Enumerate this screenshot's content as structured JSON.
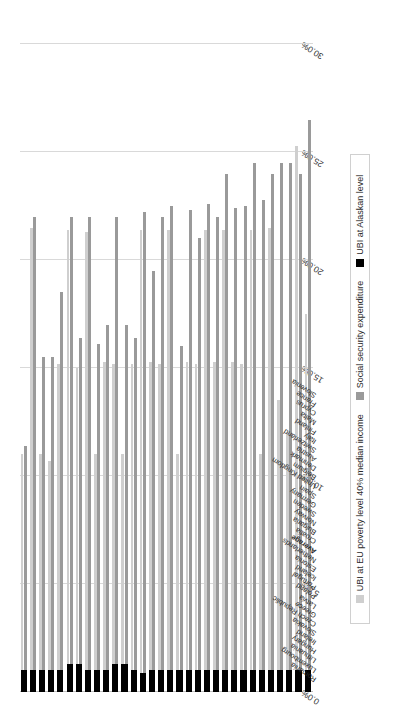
{
  "chart_data": {
    "type": "bar",
    "orientation": "horizontal",
    "title": "",
    "xlabel": "",
    "ylabel": "",
    "xlim": [
      0,
      30
    ],
    "xticks": [
      "0.0%",
      "5.0%",
      "10.0%",
      "15.0%",
      "20.0%",
      "25.0%",
      "30.0%"
    ],
    "grid": true,
    "legend_position": "bottom",
    "categories": [
      "Romania",
      "Luxembourg",
      "Lithuania",
      "Hungary",
      "Ireland",
      "Slovakia",
      "Czech Republic",
      "Greece",
      "Latvia",
      "Poland",
      "Portugal",
      "Iceland",
      "Estonia",
      "Netherlands",
      "Average",
      "Croatia",
      "Bulgaria",
      "Norway",
      "Sweden",
      "Germany",
      "Spain",
      "United Kingdom",
      "Belgium",
      "Denmark",
      "Austria",
      "Switzerland",
      "Italy",
      "Finland",
      "Malta",
      "Cyprus",
      "France",
      "Slovenia"
    ],
    "series": [
      {
        "name": "UBI at EU poverty level 40% median income",
        "color": "#cfcfcf",
        "values": [
          11.0,
          21.5,
          11.0,
          10.7,
          15.2,
          21.4,
          15.0,
          21.3,
          11.0,
          15.3,
          15.2,
          11.0,
          15.2,
          21.4,
          15.3,
          15.2,
          21.4,
          11.0,
          15.3,
          15.2,
          21.4,
          15.3,
          21.4,
          15.3,
          15.2,
          21.4,
          11.0,
          21.5,
          13.5,
          12.0,
          25.3,
          17.5
        ]
      },
      {
        "name": "Social security expenditure",
        "color": "#9a9a9a",
        "values": [
          11.4,
          22.0,
          15.5,
          15.5,
          18.5,
          22.0,
          16.4,
          22.0,
          16.1,
          17.0,
          22.0,
          17.0,
          16.4,
          22.2,
          19.5,
          22.0,
          22.5,
          16.0,
          22.3,
          21.0,
          22.6,
          22.0,
          24.0,
          22.4,
          22.5,
          24.5,
          22.8,
          24.0,
          24.5,
          24.5,
          24.0,
          26.5
        ]
      },
      {
        "name": "UBI at Alaskan level",
        "color": "#000000",
        "values": [
          1.0,
          1.0,
          1.0,
          1.0,
          1.0,
          1.3,
          1.3,
          1.0,
          1.0,
          1.0,
          1.3,
          1.3,
          1.0,
          0.9,
          1.0,
          1.0,
          1.0,
          1.0,
          1.0,
          1.0,
          1.0,
          1.0,
          1.0,
          1.0,
          1.0,
          1.0,
          1.0,
          1.0,
          1.0,
          1.0,
          1.0,
          1.0
        ]
      }
    ]
  },
  "legend": {
    "items": [
      {
        "label": "UBI at EU poverty level 40% median income",
        "color": "#cfcfcf"
      },
      {
        "label": "Social security expenditure",
        "color": "#9a9a9a"
      },
      {
        "label": "UBI at Alaskan level",
        "color": "#000000"
      }
    ]
  },
  "highlight_category": "Average"
}
